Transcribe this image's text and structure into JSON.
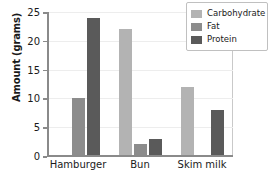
{
  "chart_data": {
    "type": "bar",
    "title": "",
    "xlabel": "",
    "ylabel": "Amount (grams)",
    "categories": [
      "Hamburger",
      "Bun",
      "Skim milk"
    ],
    "series": [
      {
        "name": "Carbohydrate",
        "color": "#b3b3b3",
        "values": [
          0,
          22,
          12
        ]
      },
      {
        "name": "Fat",
        "color": "#8c8c8c",
        "values": [
          10,
          2,
          0
        ]
      },
      {
        "name": "Protein",
        "color": "#5a5a5a",
        "values": [
          24,
          3,
          8
        ]
      }
    ],
    "ylim": [
      0,
      25
    ],
    "yticks": [
      0,
      5,
      10,
      15,
      20,
      25
    ],
    "ytick_labels": [
      "0",
      "5",
      "10",
      "15",
      "20",
      "25"
    ],
    "grid": true,
    "legend_position": "top-right"
  },
  "axis": {
    "y_title": "Amount (grams)"
  },
  "legend": {
    "entries": [
      {
        "label": "Carbohydrate"
      },
      {
        "label": "Fat"
      },
      {
        "label": "Protein"
      }
    ]
  }
}
